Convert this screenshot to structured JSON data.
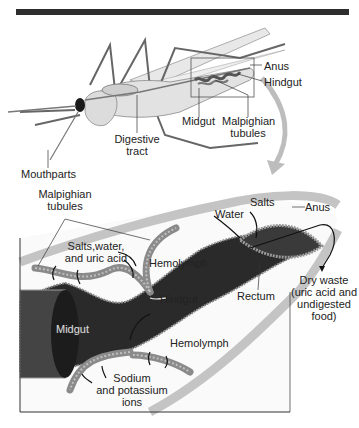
{
  "figure": {
    "top_panel": {
      "labels": {
        "anus": "Anus",
        "hindgut": "Hindgut",
        "midgut": "Midgut",
        "malpighian_1": "Malpighian",
        "malpighian_2": "tubules",
        "digestive_1": "Digestive",
        "digestive_2": "tract",
        "mouthparts": "Mouthparts"
      }
    },
    "bottom_panel": {
      "labels": {
        "malpighian_1": "Malpighian",
        "malpighian_2": "tubules",
        "salts_water_1": "Salts,water,",
        "salts_water_2": "and uric acid",
        "hemolymph_top": "Hemolymph",
        "hindgut": "Hindgut",
        "midgut": "Midgut",
        "hemolymph_bottom": "Hemolymph",
        "sodium_1": "Sodium",
        "sodium_2": "and potassium",
        "sodium_3": "ions",
        "water": "Water",
        "salts": "Salts",
        "anus": "Anus",
        "rectum": "Rectum",
        "dry_waste_1": "Dry waste",
        "dry_waste_2": "(uric acid and",
        "dry_waste_3": "undigested",
        "dry_waste_4": "food)"
      }
    },
    "colors": {
      "top_bar": "#2e2e2e",
      "body_fill": "#e2e2e2",
      "gut_dark": "#2a2a2a",
      "tubule": "#8a8a8a",
      "panel_border": "#333333"
    }
  }
}
